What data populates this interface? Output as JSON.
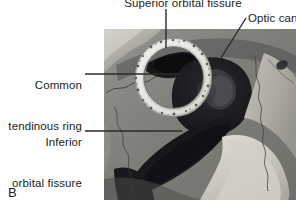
{
  "figure": {
    "panel_letter": "B",
    "background_color": "#ffffff",
    "text_color": "#1c1c1c"
  },
  "photo": {
    "description": "Grayscale photograph of a dissected bony orbit showing the common tendinous ring",
    "bounds": {
      "x": 104,
      "y": 29,
      "width": 192,
      "height": 171
    },
    "ring_color": "#e8e6e0",
    "bone_color": "#8a8a86",
    "fissure_color": "#17171a"
  },
  "labels": [
    {
      "id": "superior-orbital-fissure",
      "text": "Superior orbital fissure",
      "clipped_top": true,
      "leader": {
        "type": "vertical",
        "x1": 166,
        "y1": 9,
        "x2": 166,
        "y2": 48
      }
    },
    {
      "id": "optic-canal",
      "text": "Optic cana",
      "full_text": "Optic canal",
      "clipped_right": true,
      "leader": {
        "type": "diagonal",
        "x1": 246,
        "y1": 18,
        "x2": 221,
        "y2": 58
      }
    },
    {
      "id": "common-tendinous-ring",
      "text_line_1": "Common",
      "text_line_2": "tendinous ring",
      "leader": {
        "type": "horizontal",
        "x1": 85,
        "y1": 74,
        "x2": 181,
        "y2": 74
      }
    },
    {
      "id": "inferior-orbital-fissure",
      "text_line_1": "Inferior",
      "text_line_2": "orbital fissure",
      "leader": {
        "type": "horizontal",
        "x1": 85,
        "y1": 131,
        "x2": 182,
        "y2": 131
      }
    }
  ],
  "leader_line": {
    "color": "#2a2a2a",
    "width": 1
  }
}
